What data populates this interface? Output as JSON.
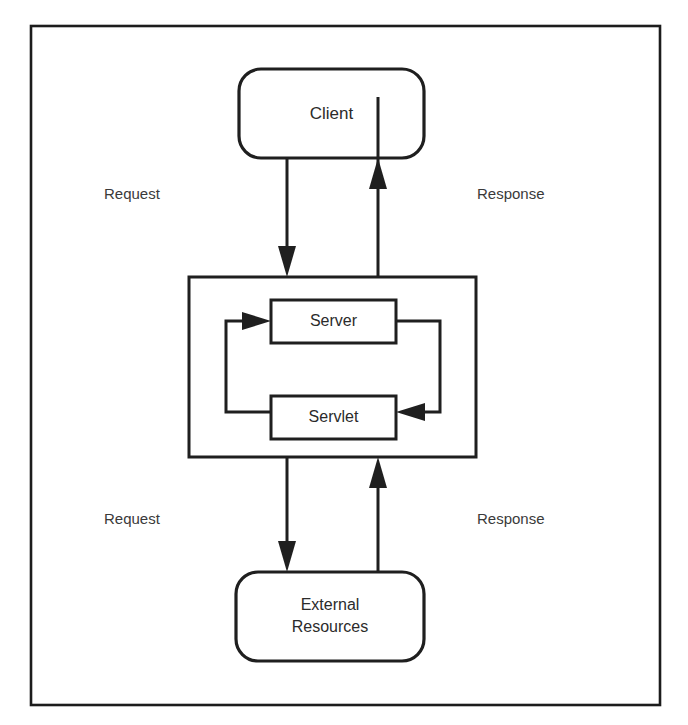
{
  "figure": {
    "border_color": "#1c1c1c",
    "background_color": "#ffffff",
    "line_color": "#1f1f1f",
    "text_color": "#2b2b2b"
  },
  "nodes": {
    "client": {
      "label": "Client",
      "shape": "rounded-rectangle"
    },
    "server_container": {
      "label": "",
      "shape": "rectangle"
    },
    "server": {
      "label": "Server",
      "shape": "rectangle"
    },
    "servlet": {
      "label": "Servlet",
      "shape": "rectangle"
    },
    "external_resources": {
      "label_line1": "External",
      "label_line2": "Resources",
      "shape": "rounded-rectangle"
    }
  },
  "edge_labels": {
    "client_request": "Request",
    "client_response": "Response",
    "external_request": "Request",
    "external_response": "Response"
  },
  "edges": [
    {
      "name": "client-to-server",
      "from": "client",
      "to": "server_container",
      "label": "Request",
      "direction": "down"
    },
    {
      "name": "server-to-client",
      "from": "server_container",
      "to": "client",
      "label": "Response",
      "direction": "up"
    },
    {
      "name": "server-to-servlet",
      "from": "server",
      "to": "servlet",
      "label": "",
      "direction": "right-loop"
    },
    {
      "name": "servlet-to-server",
      "from": "servlet",
      "to": "server",
      "label": "",
      "direction": "left-loop"
    },
    {
      "name": "server-to-external",
      "from": "server_container",
      "to": "external_resources",
      "label": "Request",
      "direction": "down"
    },
    {
      "name": "external-to-server",
      "from": "external_resources",
      "to": "server_container",
      "label": "Response",
      "direction": "up"
    }
  ]
}
